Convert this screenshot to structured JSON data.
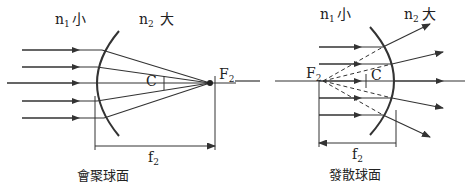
{
  "left_diagram": {
    "title": "會聚球面",
    "medium1_label": "n",
    "medium1_sub": "1",
    "medium1_size": "小",
    "medium2_label": "n",
    "medium2_sub": "2",
    "medium2_size": "大",
    "center_label": "C",
    "focus_label": "F",
    "focus_sub": "2",
    "focal_length_label": "f",
    "focal_length_sub": "2"
  },
  "right_diagram": {
    "title": "發散球面",
    "medium1_label": "n",
    "medium1_sub": "1",
    "medium1_size": "小",
    "medium2_label": "n",
    "medium2_sub": "2",
    "medium2_size": "大",
    "center_label": "C",
    "focus_label": "F",
    "focus_sub": "2",
    "focal_length_label": "f",
    "focal_length_sub": "2"
  },
  "colors": {
    "line": "#333333",
    "text": "#222222"
  }
}
